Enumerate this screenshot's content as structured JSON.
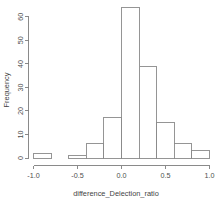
{
  "chart_data": {
    "type": "bar",
    "chart_style": "histogram",
    "title": "",
    "xlabel": "difference_Delection_ratio",
    "ylabel": "Frequency",
    "xlim": [
      -1.0,
      1.0
    ],
    "ylim": [
      0,
      65
    ],
    "grid": false,
    "legend": false,
    "bin_width": 0.2,
    "bin_starts": [
      -1.0,
      -0.8,
      -0.6,
      -0.4,
      -0.2,
      0.0,
      0.2,
      0.4,
      0.6,
      0.8
    ],
    "bin_ends": [
      -0.8,
      -0.6,
      -0.4,
      -0.2,
      0.0,
      0.2,
      0.4,
      0.6,
      0.8,
      1.0
    ],
    "categories": [
      "-1.0 to -0.8",
      "-0.8 to -0.6",
      "-0.6 to -0.4",
      "-0.4 to -0.2",
      "-0.2 to 0.0",
      "0.0 to 0.2",
      "0.2 to 0.4",
      "0.4 to 0.6",
      "0.6 to 0.8",
      "0.8 to 1.0"
    ],
    "values": [
      2,
      0,
      1,
      6,
      17,
      64,
      39,
      15,
      6,
      3
    ],
    "xticks": [
      -1.0,
      -0.5,
      0.0,
      0.5,
      1.0
    ],
    "xticklabels": [
      "-1.0",
      "-0.5",
      "0.0",
      "0.5",
      "1.0"
    ],
    "yticks": [
      0,
      10,
      20,
      30,
      40,
      50,
      60
    ],
    "yticklabels": [
      "0",
      "10",
      "20",
      "30",
      "40",
      "50",
      "60"
    ],
    "bar_fill_color": "#ffffff",
    "bar_edge_color": "#8a8a8a",
    "axis_color": "#7d7d7d",
    "background_color": "#ffffff"
  }
}
